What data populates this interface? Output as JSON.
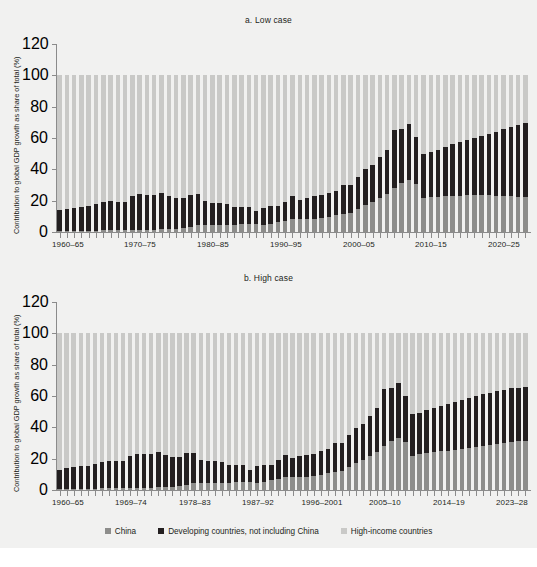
{
  "figure": {
    "background": "#f1f1f0",
    "colors": {
      "china": "#8d8d8b",
      "developing": "#231f20",
      "high_income": "#c9c9c7",
      "axis": "#8b8b8b",
      "text": "#231f20"
    }
  },
  "legend": {
    "items": [
      {
        "label": "China",
        "color": "#8d8d8b",
        "key": "china"
      },
      {
        "label": "Developing countries, not including China",
        "color": "#231f20",
        "key": "developing"
      },
      {
        "label": "High-income countries",
        "color": "#c9c9c7",
        "key": "high_income"
      }
    ]
  },
  "chart_data": [
    {
      "id": "low-case",
      "type": "bar",
      "stacked": true,
      "title": "a. Low case",
      "xlabel": "",
      "ylabel": "Contribution to global GDP growth as share of total (%)",
      "ylim": [
        0,
        120
      ],
      "yticks": [
        0,
        20,
        40,
        60,
        80,
        100,
        120
      ],
      "ytick_labels": [
        "0",
        "20",
        "40",
        "60",
        "80",
        "100",
        "120"
      ],
      "grid": false,
      "legend_position": "bottom",
      "tick_labels": [
        "1960–65",
        "1970–75",
        "1980–85",
        "1990–95",
        "2000–05",
        "2010–15",
        "2020–25"
      ],
      "tick_label_indices": [
        0,
        10,
        20,
        30,
        40,
        50,
        60
      ],
      "categories": [
        "1960–65",
        "1961–66",
        "1962–67",
        "1963–68",
        "1964–69",
        "1965–70",
        "1966–71",
        "1967–72",
        "1968–73",
        "1969–74",
        "1970–75",
        "1971–76",
        "1972–77",
        "1973–78",
        "1974–79",
        "1975–80",
        "1976–81",
        "1977–82",
        "1978–83",
        "1979–84",
        "1980–85",
        "1981–86",
        "1982–87",
        "1983–88",
        "1984–89",
        "1985–90",
        "1986–91",
        "1987–92",
        "1988–93",
        "1989–94",
        "1990–95",
        "1991–96",
        "1992–97",
        "1993–98",
        "1994–99",
        "1995–2000",
        "1996–2001",
        "1997–2002",
        "1998–2003",
        "1999–2004",
        "2000–05",
        "2001–06",
        "2002–07",
        "2003–08",
        "2004–09",
        "2005–10",
        "2006–11",
        "2007–12",
        "2008–13",
        "2009–14",
        "2010–15",
        "2011–16",
        "2012–17",
        "2013–18",
        "2014–19",
        "2015–20",
        "2016–21",
        "2017–22",
        "2018–23",
        "2019–24",
        "2020–25",
        "2021–26",
        "2022–27",
        "2023–28",
        "2024–29"
      ],
      "series": [
        {
          "name": "China",
          "key": "china",
          "color": "#8d8d8b",
          "values": [
            0.4,
            0.5,
            0.6,
            0.7,
            0.8,
            0.9,
            1.0,
            1.0,
            1.1,
            1.2,
            1.3,
            1.4,
            1.5,
            1.6,
            1.7,
            1.8,
            2.0,
            2.4,
            3.4,
            4.2,
            4.6,
            4.6,
            4.4,
            4.3,
            4.5,
            4.8,
            5.0,
            5.3,
            4.5,
            5.0,
            6.3,
            7.3,
            8.1,
            8.2,
            8.3,
            8.6,
            9.1,
            9.8,
            10.6,
            11.5,
            12.2,
            14.6,
            17.0,
            19.4,
            21.6,
            24.0,
            28.0,
            31.0,
            33.2,
            30.4,
            22.0,
            22.4,
            22.6,
            22.8,
            23.0,
            23.2,
            23.4,
            23.4,
            23.4,
            23.4,
            23.2,
            23.0,
            22.8,
            22.6,
            22.4
          ]
        },
        {
          "name": "Developing countries, not including China",
          "key": "developing",
          "color": "#231f20",
          "values": [
            13.6,
            14.3,
            15.0,
            15.4,
            15.6,
            17.1,
            18.2,
            18.6,
            18.2,
            18.2,
            21.4,
            22.6,
            22.4,
            22.1,
            23.2,
            20.9,
            19.6,
            19.0,
            20.5,
            19.8,
            15.0,
            14.2,
            14.2,
            13.8,
            11.7,
            11.3,
            10.9,
            7.9,
            10.9,
            11.5,
            10.0,
            12.1,
            14.6,
            12.5,
            13.5,
            14.1,
            14.4,
            15.0,
            15.6,
            18.8,
            18.0,
            20.8,
            23.0,
            23.4,
            26.0,
            28.6,
            37.2,
            35.0,
            35.6,
            30.2,
            27.6,
            28.6,
            30.0,
            31.2,
            33.0,
            34.4,
            35.3,
            36.5,
            37.6,
            39.2,
            40.8,
            42.5,
            44.2,
            45.5,
            47.0
          ]
        },
        {
          "name": "High-income countries",
          "key": "high_income",
          "color": "#c9c9c7",
          "values": [
            86.0,
            85.2,
            84.4,
            83.9,
            83.6,
            82.0,
            80.8,
            80.4,
            80.7,
            80.6,
            77.3,
            76.0,
            76.1,
            76.3,
            75.1,
            77.3,
            78.4,
            78.6,
            76.1,
            76.0,
            80.4,
            81.2,
            81.4,
            81.9,
            83.8,
            83.9,
            84.1,
            86.8,
            84.6,
            83.5,
            83.7,
            80.6,
            77.3,
            79.3,
            78.2,
            77.3,
            76.5,
            75.2,
            73.8,
            69.7,
            69.8,
            64.6,
            60.0,
            57.2,
            52.4,
            47.4,
            34.8,
            34.0,
            31.2,
            39.4,
            50.4,
            49.0,
            47.4,
            46.0,
            44.0,
            42.4,
            41.3,
            40.1,
            39.0,
            37.4,
            36.0,
            34.5,
            33.0,
            31.9,
            30.6
          ]
        }
      ]
    },
    {
      "id": "high-case",
      "type": "bar",
      "stacked": true,
      "title": "b. High case",
      "xlabel": "",
      "ylabel": "Contribution to global GDP growth as share of total (%)",
      "ylim": [
        0,
        120
      ],
      "yticks": [
        0,
        20,
        40,
        60,
        80,
        100,
        120
      ],
      "ytick_labels": [
        "0",
        "20",
        "40",
        "60",
        "80",
        "100",
        "120"
      ],
      "grid": false,
      "legend_position": "bottom",
      "tick_labels": [
        "1960–65",
        "1969–74",
        "1978–83",
        "1987–92",
        "1996–2001",
        "2005–10",
        "2014–19",
        "2023–28"
      ],
      "tick_label_indices": [
        0,
        9,
        18,
        27,
        36,
        45,
        54,
        63
      ],
      "categories": [
        "1960–65",
        "1961–66",
        "1962–67",
        "1963–68",
        "1964–69",
        "1965–70",
        "1966–71",
        "1967–72",
        "1968–73",
        "1969–74",
        "1970–75",
        "1971–76",
        "1972–77",
        "1973–78",
        "1974–79",
        "1975–80",
        "1976–81",
        "1977–82",
        "1978–83",
        "1979–84",
        "1980–85",
        "1981–86",
        "1982–87",
        "1983–88",
        "1984–89",
        "1985–90",
        "1986–91",
        "1987–92",
        "1988–93",
        "1989–94",
        "1990–95",
        "1991–96",
        "1992–97",
        "1993–98",
        "1994–99",
        "1995–2000",
        "1996–2001",
        "1997–2002",
        "1998–2003",
        "1999–2004",
        "2000–05",
        "2001–06",
        "2002–07",
        "2003–08",
        "2004–09",
        "2005–10",
        "2006–11",
        "2007–12",
        "2008–13",
        "2009–14",
        "2010–15",
        "2011–16",
        "2012–17",
        "2013–18",
        "2014–19",
        "2015–20",
        "2016–21",
        "2017–22",
        "2018–23",
        "2019–24",
        "2020–25",
        "2021–26",
        "2022–27",
        "2023–28",
        "2024–29",
        "2025–30",
        "2026–31"
      ],
      "series": [
        {
          "name": "China",
          "key": "china",
          "color": "#8d8d8b",
          "values": [
            0.4,
            0.5,
            0.6,
            0.7,
            0.8,
            0.9,
            1.0,
            1.0,
            1.1,
            1.2,
            1.3,
            1.4,
            1.5,
            1.6,
            1.7,
            1.8,
            2.0,
            2.4,
            3.4,
            4.2,
            4.6,
            4.6,
            4.4,
            4.3,
            4.5,
            4.8,
            5.0,
            5.3,
            4.5,
            5.0,
            6.3,
            7.3,
            8.1,
            8.2,
            8.3,
            8.6,
            9.1,
            9.8,
            10.6,
            11.5,
            12.2,
            14.6,
            17.0,
            19.4,
            21.6,
            24.0,
            28.0,
            31.0,
            33.2,
            30.4,
            22.0,
            22.8,
            23.4,
            24.0,
            24.6,
            25.2,
            25.8,
            26.4,
            27.0,
            27.6,
            28.2,
            28.8,
            29.4,
            30.0,
            30.6,
            31.0,
            31.4
          ]
        },
        {
          "name": "Developing countries, not including China",
          "key": "developing",
          "color": "#231f20",
          "values": [
            12.6,
            13.4,
            14.0,
            14.5,
            14.8,
            16.0,
            17.2,
            17.6,
            17.4,
            17.6,
            20.4,
            21.8,
            21.8,
            21.4,
            22.6,
            20.4,
            19.2,
            18.6,
            20.0,
            19.2,
            14.6,
            13.8,
            14.0,
            13.4,
            11.4,
            11.0,
            10.8,
            7.6,
            10.6,
            11.2,
            9.8,
            11.8,
            14.2,
            12.2,
            13.2,
            13.8,
            14.2,
            14.8,
            15.4,
            18.4,
            17.6,
            20.4,
            22.6,
            23.0,
            25.6,
            28.2,
            36.6,
            34.4,
            35.0,
            29.6,
            26.4,
            26.6,
            27.4,
            28.2,
            29.2,
            29.8,
            30.4,
            31.0,
            31.6,
            32.2,
            32.8,
            33.2,
            33.6,
            34.0,
            34.2,
            34.4,
            34.6
          ]
        },
        {
          "name": "High-income countries",
          "key": "high_income",
          "color": "#c9c9c7",
          "values": [
            87.0,
            86.1,
            85.4,
            84.8,
            84.4,
            83.1,
            81.8,
            81.4,
            81.5,
            81.2,
            78.3,
            76.8,
            76.7,
            77.0,
            75.7,
            77.8,
            78.8,
            79.0,
            76.6,
            76.6,
            80.8,
            81.6,
            81.6,
            82.3,
            84.1,
            84.2,
            84.2,
            87.1,
            84.9,
            83.8,
            83.9,
            80.9,
            77.7,
            79.6,
            78.5,
            77.6,
            76.7,
            75.4,
            74.0,
            70.1,
            70.2,
            65.0,
            60.4,
            57.6,
            52.8,
            47.8,
            35.4,
            34.6,
            31.8,
            40.0,
            51.6,
            50.6,
            49.2,
            47.8,
            46.2,
            45.0,
            43.8,
            42.6,
            41.4,
            40.2,
            39.0,
            38.0,
            37.0,
            36.0,
            35.2,
            34.6,
            34.0
          ]
        }
      ]
    }
  ]
}
